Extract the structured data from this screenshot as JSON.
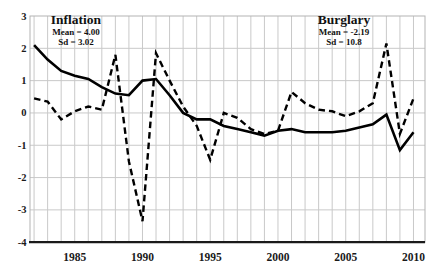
{
  "chart_data": {
    "type": "line",
    "title": "",
    "xlabel": "",
    "ylabel": "",
    "x": [
      1982,
      1983,
      1984,
      1985,
      1986,
      1987,
      1988,
      1989,
      1990,
      1991,
      1992,
      1993,
      1994,
      1995,
      1996,
      1997,
      1998,
      1999,
      2000,
      2001,
      2002,
      2003,
      2004,
      2005,
      2006,
      2007,
      2008,
      2009,
      2010
    ],
    "series": [
      {
        "name": "Inflation",
        "style": "solid",
        "values": [
          2.1,
          1.65,
          1.3,
          1.15,
          1.05,
          0.8,
          0.6,
          0.55,
          1.0,
          1.05,
          0.55,
          0.0,
          -0.2,
          -0.2,
          -0.4,
          -0.5,
          -0.6,
          -0.7,
          -0.55,
          -0.5,
          -0.6,
          -0.6,
          -0.6,
          -0.55,
          -0.45,
          -0.35,
          -0.05,
          -1.15,
          -0.6
        ]
      },
      {
        "name": "Burglary",
        "style": "dashed",
        "values": [
          0.45,
          0.35,
          -0.2,
          0.05,
          0.2,
          0.1,
          1.8,
          -1.5,
          -3.35,
          1.85,
          1.0,
          0.2,
          -0.4,
          -1.45,
          0.0,
          -0.15,
          -0.5,
          -0.65,
          -0.55,
          0.65,
          0.3,
          0.1,
          0.05,
          -0.1,
          0.05,
          0.3,
          2.15,
          -0.65,
          0.45
        ]
      }
    ],
    "annotations": [
      {
        "label": "Inflation",
        "mean_label": "Mean = 4.00",
        "sd_label": "Sd = 3.02"
      },
      {
        "label": "Burglary",
        "mean_label": "Mean = -2.19",
        "sd_label": "Sd =  10.8"
      }
    ],
    "x_ticks": [
      "1985",
      "1990",
      "1995",
      "2000",
      "2005",
      "2010"
    ],
    "y_ticks": [
      "3",
      "2",
      "1",
      "0",
      "-1",
      "-2",
      "-3",
      "-4"
    ],
    "xlim": [
      1981.7,
      2010.85
    ],
    "ylim": [
      -4,
      3
    ],
    "grid": true,
    "legend_position": "none",
    "colors": {
      "line": "#000000",
      "grid": "#c9c9c9",
      "frame": "#b3b3b3",
      "axis": "#1a1a1a",
      "background": "#ffffff",
      "tick_text": "#1a1a1a"
    }
  }
}
